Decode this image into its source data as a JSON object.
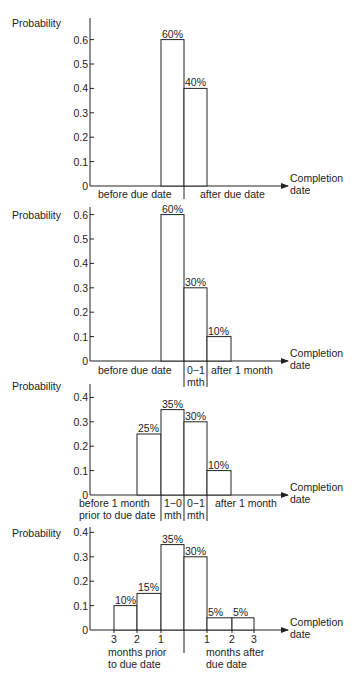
{
  "chart_data": [
    {
      "type": "bar",
      "title": "",
      "ylabel": "Probability",
      "xlabel": "Completion date",
      "yticks": [
        "0",
        "0.1",
        "0.2",
        "0.3",
        "0.4",
        "0.5",
        "0.6"
      ],
      "ylim": [
        0,
        0.65
      ],
      "categories": [
        "before due date",
        "after due date"
      ],
      "values": [
        0.6,
        0.4
      ],
      "data_labels": [
        "60%",
        "40%"
      ],
      "x_labels": [
        {
          "text": "before due date"
        },
        {
          "text": "after due date"
        }
      ]
    },
    {
      "type": "bar",
      "title": "",
      "ylabel": "Probability",
      "xlabel": "Completion date",
      "yticks": [
        "0",
        "0.1",
        "0.2",
        "0.3",
        "0.4",
        "0.5",
        "0.6"
      ],
      "ylim": [
        0,
        0.62
      ],
      "categories": [
        "before due date",
        "0-1 mth",
        "after 1 month"
      ],
      "values": [
        0.6,
        0.3,
        0.1
      ],
      "data_labels": [
        "60%",
        "30%",
        "10%"
      ],
      "x_labels": [
        {
          "text": "before due date"
        },
        {
          "text": "0−1",
          "text2": "mth"
        },
        {
          "text": "after 1 month"
        }
      ]
    },
    {
      "type": "bar",
      "title": "",
      "ylabel": "Probability",
      "xlabel": "Completion date",
      "yticks": [
        "0",
        "0.1",
        "0.2",
        "0.3",
        "0.4"
      ],
      "ylim": [
        0,
        0.45
      ],
      "categories": [
        "before 1 month prior to due date",
        "1-0 mth",
        "0-1 mth",
        "after 1 month"
      ],
      "values": [
        0.25,
        0.35,
        0.3,
        0.1
      ],
      "data_labels": [
        "25%",
        "35%",
        "30%",
        "10%"
      ],
      "x_labels": [
        {
          "text": "before 1 month",
          "text2": "prior to due date"
        },
        {
          "text": "1−0",
          "text2": "mth"
        },
        {
          "text": "0−1",
          "text2": "mth"
        },
        {
          "text": "after 1 month"
        }
      ]
    },
    {
      "type": "bar",
      "title": "",
      "ylabel": "Probability",
      "xlabel": "Completion date",
      "yticks": [
        "0",
        "0.1",
        "0.2",
        "0.3",
        "0.4"
      ],
      "ylim": [
        0,
        0.42
      ],
      "categories": [
        "3-2 months prior",
        "2-1 months prior",
        "1-0 months prior",
        "0-1 months after",
        "1-2 months after",
        "2-3 months after"
      ],
      "values": [
        0.1,
        0.15,
        0.35,
        0.3,
        0.05,
        0.05
      ],
      "data_labels": [
        "10%",
        "15%",
        "35%",
        "30%",
        "5%",
        "5%"
      ],
      "x_ticks": [
        "3",
        "2",
        "1",
        "1",
        "2",
        "3"
      ],
      "x_group_labels": {
        "before": [
          "months prior",
          "to due date"
        ],
        "after": [
          "months after",
          "due date"
        ]
      }
    }
  ],
  "labels": {
    "probability": "Probability",
    "completion": "Completion",
    "date": "date"
  }
}
